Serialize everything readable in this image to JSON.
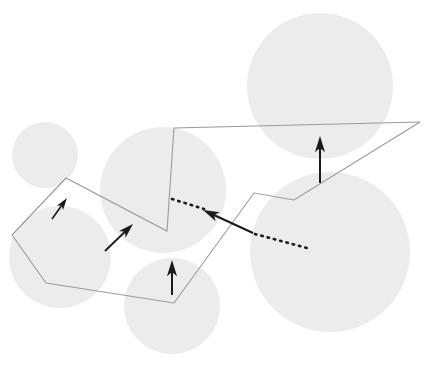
{
  "figure": {
    "width": 427,
    "height": 379,
    "background_color": "#ffffff"
  },
  "palette": {
    "disk_fill": "#ececec",
    "disk_overlap_fill": "#d6d6d6",
    "corridor_stroke": "#9a9a9a",
    "arrow_color": "#1a1a1a",
    "dotted_color": "#1a1a1a",
    "background": "#ffffff"
  },
  "geometry": {
    "disks": [
      {
        "name": "disk-upper-left-small",
        "cx": 45,
        "cy": 155,
        "r": 33
      },
      {
        "name": "disk-lower-left",
        "cx": 60,
        "cy": 257,
        "r": 51
      },
      {
        "name": "disk-center",
        "cx": 163,
        "cy": 190,
        "r": 63
      },
      {
        "name": "disk-bottom-center",
        "cx": 172,
        "cy": 306,
        "r": 48
      },
      {
        "name": "disk-upper-right-large",
        "cx": 320,
        "cy": 86,
        "r": 73
      },
      {
        "name": "disk-lower-right-large",
        "cx": 330,
        "cy": 252,
        "r": 80
      }
    ],
    "overlap_pairs": [
      [
        "disk-upper-left-small",
        "disk-lower-left"
      ],
      [
        "disk-lower-left",
        "disk-center"
      ],
      [
        "disk-center",
        "disk-bottom-center"
      ],
      [
        "disk-center",
        "disk-lower-right-large"
      ],
      [
        "disk-upper-right-large",
        "disk-lower-right-large"
      ],
      [
        "disk-bottom-center",
        "disk-lower-right-large"
      ]
    ],
    "corridor": {
      "name": "polygonal-corridor",
      "stroke_width": 1.1,
      "upper_chain": [
        [
          12,
          235
        ],
        [
          66,
          178
        ],
        [
          167,
          231
        ],
        [
          174,
          128
        ],
        [
          420,
          122
        ]
      ],
      "lower_chain": [
        [
          46,
          283
        ],
        [
          174,
          303
        ],
        [
          254,
          193
        ],
        [
          294,
          200
        ],
        [
          420,
          122
        ]
      ],
      "left_cap": [
        [
          12,
          235
        ],
        [
          46,
          283
        ]
      ]
    },
    "arrows": [
      {
        "name": "normal-vector-1",
        "tail": [
          52,
          219
        ],
        "head": [
          67,
          198
        ],
        "head_size": 9,
        "shaft_width": 1.6
      },
      {
        "name": "normal-vector-2",
        "tail": [
          105,
          251
        ],
        "head": [
          133,
          224
        ],
        "head_size": 11,
        "shaft_width": 1.8
      },
      {
        "name": "normal-vector-3",
        "tail": [
          172,
          295
        ],
        "head": [
          172,
          260
        ],
        "head_size": 12,
        "shaft_width": 2.0
      },
      {
        "name": "normal-vector-4",
        "tail": [
          253,
          233
        ],
        "head": [
          203,
          210
        ],
        "head_size": 12,
        "shaft_width": 2.0
      },
      {
        "name": "normal-vector-5",
        "tail": [
          320,
          183
        ],
        "head": [
          320,
          136
        ],
        "head_size": 12,
        "shaft_width": 2.0
      }
    ],
    "dotted_segments": [
      {
        "name": "dotted-separator-left",
        "from": [
          172,
          199
        ],
        "to": [
          204,
          209
        ],
        "dot_radius": 1.3,
        "dash": "1.5 5"
      },
      {
        "name": "dotted-separator-right",
        "from": [
          255,
          234
        ],
        "to": [
          307,
          248
        ],
        "dot_radius": 1.3,
        "dash": "1.5 5"
      }
    ]
  },
  "labels": {
    "caption": "",
    "annotations": []
  }
}
